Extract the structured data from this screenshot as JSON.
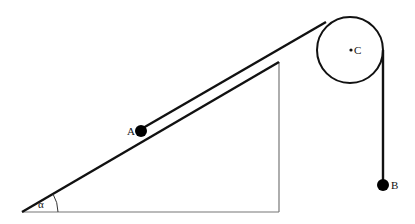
{
  "diagram": {
    "type": "physics-incline-pulley",
    "labels": {
      "mass_a": "A",
      "mass_b": "B",
      "pulley_center": "C",
      "angle": "α"
    },
    "colors": {
      "line": "#111111",
      "thin_line": "#555555",
      "background": "#ffffff"
    }
  }
}
